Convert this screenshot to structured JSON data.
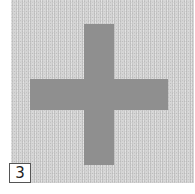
{
  "image": {
    "shape": "plus-sign",
    "background_color": "#d6d6d6",
    "shape_color": "#8f8f8f",
    "label": "3"
  }
}
